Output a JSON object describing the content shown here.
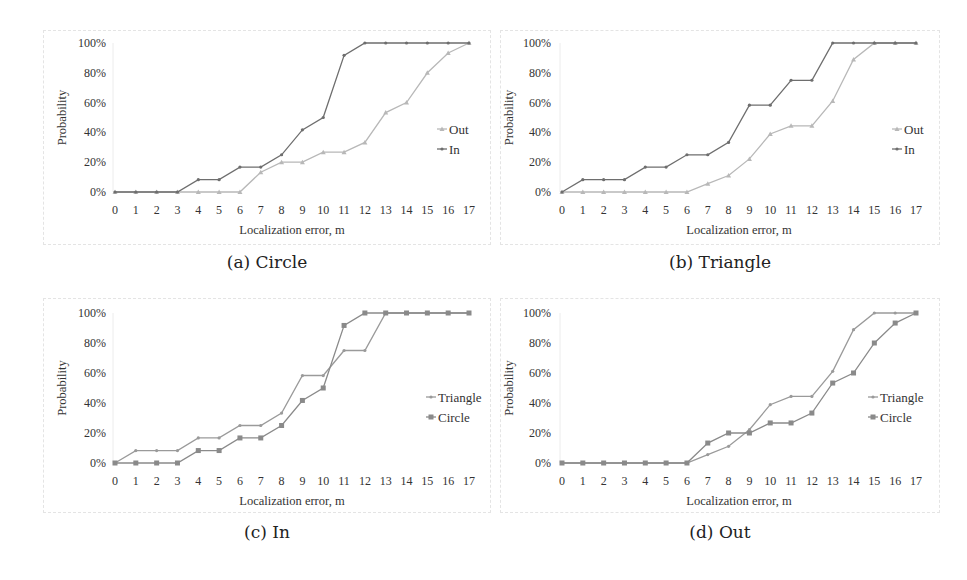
{
  "chart_data": [
    {
      "type": "line",
      "caption": "(a) Circle",
      "xlabel": "Localization error,  m",
      "ylabel": "Probability",
      "x": [
        0,
        1,
        2,
        3,
        4,
        5,
        6,
        7,
        8,
        9,
        10,
        11,
        12,
        13,
        14,
        15,
        16,
        17
      ],
      "yticks": [
        "0%",
        "20%",
        "40%",
        "60%",
        "80%",
        "100%"
      ],
      "ylim": [
        0,
        100
      ],
      "grid": false,
      "legend_position": "right",
      "series": [
        {
          "name": "Out",
          "color": "#b8b8b8",
          "marker": "triangle",
          "values": [
            0,
            0,
            0,
            0,
            0,
            0,
            0,
            13.3,
            20,
            20,
            26.7,
            26.7,
            33.3,
            53.3,
            60,
            80,
            93.3,
            100
          ]
        },
        {
          "name": "In",
          "color": "#6e6e6e",
          "marker": "dot",
          "values": [
            0,
            0,
            0,
            0,
            8.3,
            8.3,
            16.7,
            16.7,
            25,
            41.7,
            50,
            91.7,
            100,
            100,
            100,
            100,
            100,
            100
          ]
        }
      ]
    },
    {
      "type": "line",
      "caption": "(b) Triangle",
      "xlabel": "Localization error,  m",
      "ylabel": "Probability",
      "x": [
        0,
        1,
        2,
        3,
        4,
        5,
        6,
        7,
        8,
        9,
        10,
        11,
        12,
        13,
        14,
        15,
        16,
        17
      ],
      "yticks": [
        "0%",
        "20%",
        "40%",
        "60%",
        "80%",
        "100%"
      ],
      "ylim": [
        0,
        100
      ],
      "grid": false,
      "legend_position": "right",
      "series": [
        {
          "name": "Out",
          "color": "#b8b8b8",
          "marker": "triangle",
          "values": [
            0,
            0,
            0,
            0,
            0,
            0,
            0,
            5.6,
            11.1,
            22.2,
            38.9,
            44.4,
            44.4,
            61.1,
            88.9,
            100,
            100,
            100
          ]
        },
        {
          "name": "In",
          "color": "#6e6e6e",
          "marker": "dot",
          "values": [
            0,
            8.3,
            8.3,
            8.3,
            16.7,
            16.7,
            25,
            25,
            33.3,
            58.3,
            58.3,
            75,
            75,
            100,
            100,
            100,
            100,
            100
          ]
        }
      ]
    },
    {
      "type": "line",
      "caption": "(c) In",
      "xlabel": "Localization error, m",
      "ylabel": "Probability",
      "x": [
        0,
        1,
        2,
        3,
        4,
        5,
        6,
        7,
        8,
        9,
        10,
        11,
        12,
        13,
        14,
        15,
        16,
        17
      ],
      "yticks": [
        "0%",
        "20%",
        "40%",
        "60%",
        "80%",
        "100%"
      ],
      "ylim": [
        0,
        100
      ],
      "grid": false,
      "legend_position": "right",
      "series": [
        {
          "name": "Triangle",
          "color": "#9a9a9a",
          "marker": "dot",
          "values": [
            0,
            8.3,
            8.3,
            8.3,
            16.7,
            16.7,
            25,
            25,
            33.3,
            58.3,
            58.3,
            75,
            75,
            100,
            100,
            100,
            100,
            100
          ]
        },
        {
          "name": "Circle",
          "color": "#8a8a8a",
          "marker": "square",
          "values": [
            0,
            0,
            0,
            0,
            8.3,
            8.3,
            16.7,
            16.7,
            25,
            41.7,
            50,
            91.7,
            100,
            100,
            100,
            100,
            100,
            100
          ]
        }
      ]
    },
    {
      "type": "line",
      "caption": "(d) Out",
      "xlabel": "Localization error, m",
      "ylabel": "Probability",
      "x": [
        0,
        1,
        2,
        3,
        4,
        5,
        6,
        7,
        8,
        9,
        10,
        11,
        12,
        13,
        14,
        15,
        16,
        17
      ],
      "yticks": [
        "0%",
        "20%",
        "40%",
        "60%",
        "80%",
        "100%"
      ],
      "ylim": [
        0,
        100
      ],
      "grid": false,
      "legend_position": "right",
      "series": [
        {
          "name": "Triangle",
          "color": "#9a9a9a",
          "marker": "dot",
          "values": [
            0,
            0,
            0,
            0,
            0,
            0,
            0,
            5.6,
            11.1,
            22.2,
            38.9,
            44.4,
            44.4,
            61.1,
            88.9,
            100,
            100,
            100
          ]
        },
        {
          "name": "Circle",
          "color": "#8a8a8a",
          "marker": "square",
          "values": [
            0,
            0,
            0,
            0,
            0,
            0,
            0,
            13.3,
            20,
            20,
            26.7,
            26.7,
            33.3,
            53.3,
            60,
            80,
            93.3,
            100
          ]
        }
      ]
    }
  ]
}
